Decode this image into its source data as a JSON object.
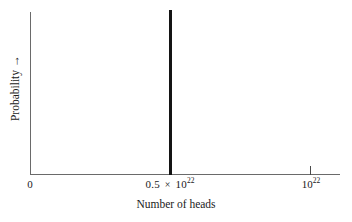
{
  "figure": {
    "background_color": "#ffffff",
    "axis_color": "#6a6a6a",
    "spike_color": "#141414"
  },
  "axes": {
    "x_title": "Number of heads",
    "y_title": "Probability",
    "y_title_arrow": "→",
    "times_symbol": "×"
  },
  "ticks": {
    "x": [
      {
        "label_prefix": "0",
        "mantissa": "",
        "exponent": "",
        "has_tick_mark": false
      },
      {
        "label_prefix": "0.5",
        "mantissa": "10",
        "exponent": "22",
        "has_tick_mark": true
      },
      {
        "label_prefix": "",
        "mantissa": "10",
        "exponent": "22",
        "has_tick_mark": true
      }
    ]
  },
  "chart_data": {
    "type": "line",
    "title": "",
    "subtitle": "",
    "xlabel": "Number of heads",
    "ylabel": "Probability",
    "grid": false,
    "legend": null,
    "legend_position": null,
    "xlim": [
      0,
      1.1e+22
    ],
    "ylim": [
      0,
      1
    ],
    "xtick_values": [
      0,
      5e+21,
      1e+22
    ],
    "xtick_labels": [
      "0",
      "0.5 × 10²²",
      "10²²"
    ],
    "ytick_values": [],
    "ytick_labels": [],
    "annotations": [],
    "series": [
      {
        "name": "Probability distribution of number of heads",
        "description": "Extremely sharp spike (delta-function-like) centred at half the total number of coin flips",
        "x": [
          0,
          5e+21,
          5e+21,
          5e+21,
          1.1e+22
        ],
        "y": [
          0,
          0,
          1,
          0,
          0
        ],
        "peak_x": 5e+21,
        "peak_x_label": "0.5 × 10²²",
        "peak_y": 1,
        "color": "#141414",
        "linewidth": 3
      }
    ]
  }
}
